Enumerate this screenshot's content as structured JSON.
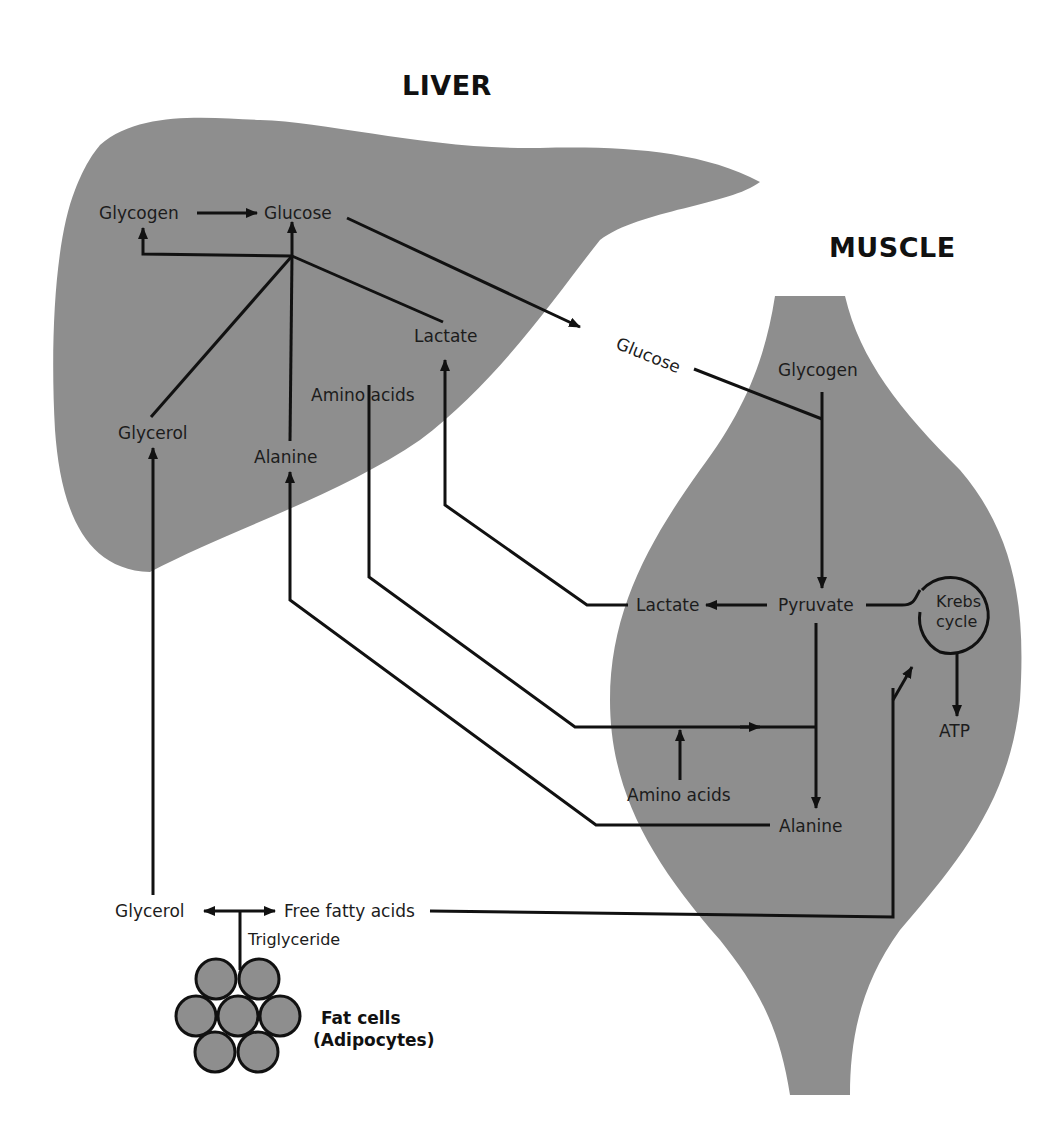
{
  "organs": {
    "liver": {
      "title": "LIVER",
      "fill": "#8e8e8e"
    },
    "muscle": {
      "title": "MUSCLE",
      "fill": "#8e8e8e"
    },
    "fat_cells": {
      "title_line1": "Fat cells",
      "title_line2": "(Adipocytes)",
      "fill": "#8e8e8e"
    }
  },
  "liver_labels": {
    "glycogen": "Glycogen",
    "glucose": "Glucose",
    "lactate": "Lactate",
    "amino_acids": "Amino acids",
    "glycerol": "Glycerol",
    "alanine": "Alanine"
  },
  "blood_labels": {
    "glucose": "Glucose"
  },
  "muscle_labels": {
    "glycogen": "Glycogen",
    "pyruvate": "Pyruvate",
    "lactate": "Lactate",
    "krebs_line1": "Krebs",
    "krebs_line2": "cycle",
    "atp": "ATP",
    "amino_acids": "Amino acids",
    "alanine": "Alanine"
  },
  "adipose_labels": {
    "glycerol": "Glycerol",
    "free_fatty_acids": "Free fatty acids",
    "triglyceride": "Triglyceride"
  },
  "colors": {
    "line": "#111111",
    "organ": "#8e8e8e",
    "background": "#ffffff"
  }
}
